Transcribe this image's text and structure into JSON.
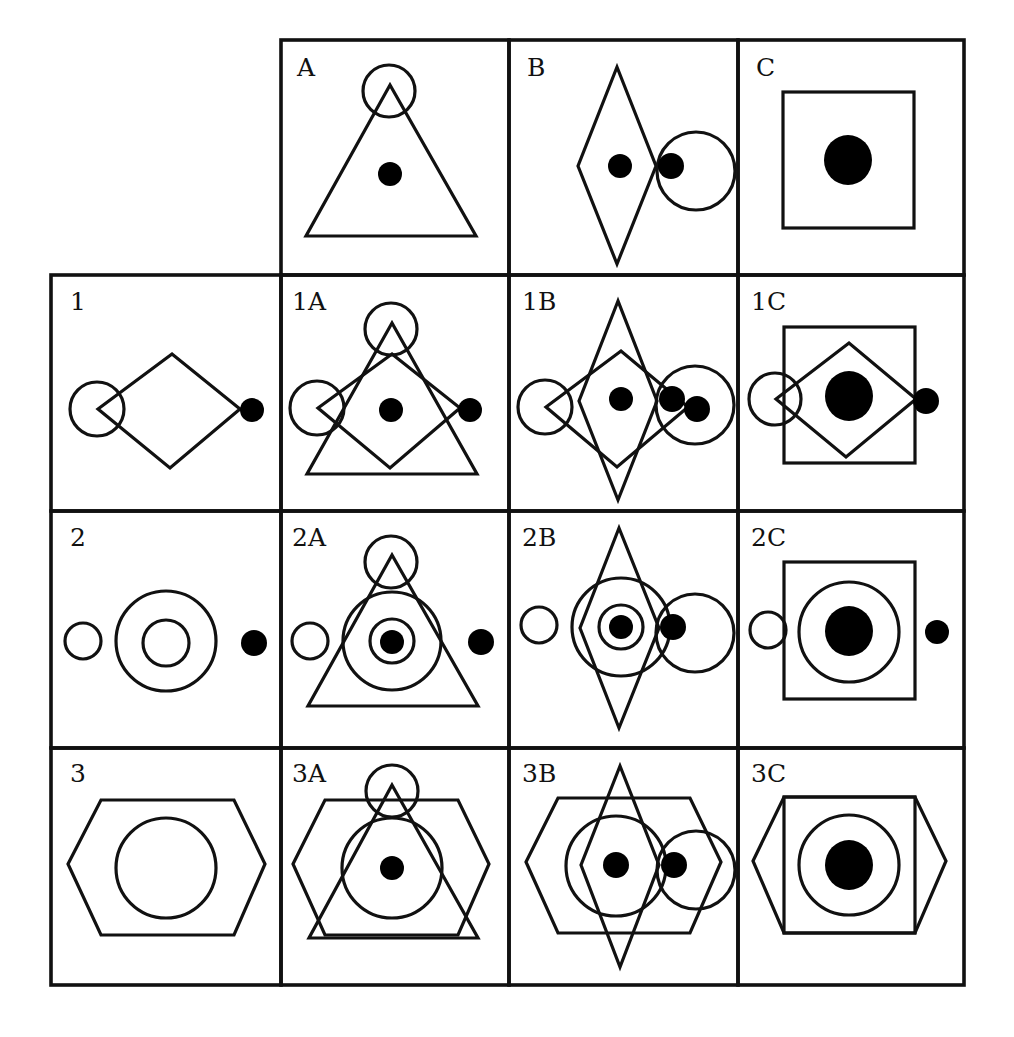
{
  "diagram": {
    "title": "",
    "grid": {
      "col_edges": [
        51,
        281,
        509,
        738,
        964
      ],
      "row_edges": [
        40,
        275,
        511,
        748,
        985
      ],
      "stroke_color": "#111111"
    },
    "cells": [
      {
        "id": "A",
        "label": "A",
        "col": 1,
        "row": 0,
        "label_pos": [
          297,
          76
        ],
        "shapes": [
          {
            "type": "polygon",
            "points": [
              [
                390,
                85
              ],
              [
                306,
                236
              ],
              [
                476,
                236
              ]
            ]
          },
          {
            "type": "circle",
            "cx": 389,
            "cy": 91,
            "r": 26
          },
          {
            "type": "dot",
            "cx": 390,
            "cy": 174,
            "r": 12
          }
        ]
      },
      {
        "id": "B",
        "label": "B",
        "col": 2,
        "row": 0,
        "label_pos": [
          527,
          76
        ],
        "shapes": [
          {
            "type": "polygon",
            "points": [
              [
                617,
                67
              ],
              [
                578,
                166
              ],
              [
                617,
                264
              ],
              [
                656,
                166
              ]
            ]
          },
          {
            "type": "circle",
            "cx": 696,
            "cy": 171,
            "r": 39
          },
          {
            "type": "dot",
            "cx": 620,
            "cy": 166,
            "r": 12
          },
          {
            "type": "dot",
            "cx": 671,
            "cy": 166,
            "r": 13
          }
        ]
      },
      {
        "id": "C",
        "label": "C",
        "col": 3,
        "row": 0,
        "label_pos": [
          756,
          76
        ],
        "shapes": [
          {
            "type": "rect",
            "x": 783,
            "y": 92,
            "w": 131,
            "h": 136
          },
          {
            "type": "ellipse",
            "cx": 848,
            "cy": 160,
            "rx": 24,
            "ry": 25
          }
        ]
      },
      {
        "id": "1",
        "label": "1",
        "col": 0,
        "row": 1,
        "label_pos": [
          70,
          310
        ],
        "shapes": [
          {
            "type": "polygon",
            "points": [
              [
                98,
                409
              ],
              [
                172,
                354
              ],
              [
                240,
                409
              ],
              [
                170,
                468
              ]
            ]
          },
          {
            "type": "circle",
            "cx": 97,
            "cy": 409,
            "r": 27
          },
          {
            "type": "dot",
            "cx": 252,
            "cy": 410,
            "r": 12
          }
        ]
      },
      {
        "id": "1A",
        "label": "1A",
        "col": 1,
        "row": 1,
        "label_pos": [
          292,
          310
        ],
        "shapes": [
          {
            "type": "polygon",
            "points": [
              [
                392,
                323
              ],
              [
                307,
                474
              ],
              [
                477,
                474
              ]
            ]
          },
          {
            "type": "polygon",
            "points": [
              [
                318,
                408
              ],
              [
                392,
                354
              ],
              [
                460,
                408
              ],
              [
                390,
                468
              ]
            ]
          },
          {
            "type": "circle",
            "cx": 391,
            "cy": 329,
            "r": 26
          },
          {
            "type": "circle",
            "cx": 317,
            "cy": 408,
            "r": 27
          },
          {
            "type": "dot",
            "cx": 391,
            "cy": 410,
            "r": 12
          },
          {
            "type": "dot",
            "cx": 470,
            "cy": 410,
            "r": 12
          }
        ]
      },
      {
        "id": "1B",
        "label": "1B",
        "col": 2,
        "row": 1,
        "label_pos": [
          522,
          310
        ],
        "shapes": [
          {
            "type": "polygon",
            "points": [
              [
                618,
                301
              ],
              [
                579,
                401
              ],
              [
                618,
                500
              ],
              [
                657,
                401
              ]
            ]
          },
          {
            "type": "polygon",
            "points": [
              [
                546,
                407
              ],
              [
                621,
                351
              ],
              [
                688,
                407
              ],
              [
                617,
                467
              ]
            ]
          },
          {
            "type": "circle",
            "cx": 545,
            "cy": 407,
            "r": 27
          },
          {
            "type": "circle",
            "cx": 695,
            "cy": 405,
            "r": 39
          },
          {
            "type": "dot",
            "cx": 621,
            "cy": 399,
            "r": 12
          },
          {
            "type": "dot",
            "cx": 672,
            "cy": 399,
            "r": 13
          },
          {
            "type": "dot",
            "cx": 697,
            "cy": 409,
            "r": 13
          }
        ]
      },
      {
        "id": "1C",
        "label": "1C",
        "col": 3,
        "row": 1,
        "label_pos": [
          751,
          310
        ],
        "shapes": [
          {
            "type": "rect",
            "x": 784,
            "y": 327,
            "w": 131,
            "h": 136
          },
          {
            "type": "polygon",
            "points": [
              [
                776,
                399
              ],
              [
                849,
                343
              ],
              [
                916,
                399
              ],
              [
                846,
                457
              ]
            ]
          },
          {
            "type": "circle",
            "cx": 775,
            "cy": 399,
            "r": 26
          },
          {
            "type": "ellipse",
            "cx": 849,
            "cy": 396,
            "rx": 24,
            "ry": 25
          },
          {
            "type": "dot",
            "cx": 926,
            "cy": 401,
            "r": 13
          }
        ]
      },
      {
        "id": "2",
        "label": "2",
        "col": 0,
        "row": 2,
        "label_pos": [
          70,
          546
        ],
        "shapes": [
          {
            "type": "circle",
            "cx": 83,
            "cy": 641,
            "r": 18
          },
          {
            "type": "circle",
            "cx": 166,
            "cy": 641,
            "r": 50
          },
          {
            "type": "circle",
            "cx": 166,
            "cy": 643,
            "r": 23
          },
          {
            "type": "dot",
            "cx": 254,
            "cy": 643,
            "r": 13
          }
        ]
      },
      {
        "id": "2A",
        "label": "2A",
        "col": 1,
        "row": 2,
        "label_pos": [
          292,
          546
        ],
        "shapes": [
          {
            "type": "polygon",
            "points": [
              [
                392,
                555
              ],
              [
                308,
                706
              ],
              [
                478,
                706
              ]
            ]
          },
          {
            "type": "circle",
            "cx": 391,
            "cy": 562,
            "r": 26
          },
          {
            "type": "circle",
            "cx": 392,
            "cy": 641,
            "r": 49
          },
          {
            "type": "circle",
            "cx": 392,
            "cy": 641,
            "r": 22
          },
          {
            "type": "circle",
            "cx": 310,
            "cy": 641,
            "r": 18
          },
          {
            "type": "dot",
            "cx": 392,
            "cy": 642,
            "r": 12
          },
          {
            "type": "dot",
            "cx": 481,
            "cy": 642,
            "r": 13
          }
        ]
      },
      {
        "id": "2B",
        "label": "2B",
        "col": 2,
        "row": 2,
        "label_pos": [
          522,
          546
        ],
        "shapes": [
          {
            "type": "polygon",
            "points": [
              [
                619,
                528
              ],
              [
                580,
                628
              ],
              [
                619,
                728
              ],
              [
                659,
                628
              ]
            ]
          },
          {
            "type": "circle",
            "cx": 621,
            "cy": 627,
            "r": 49
          },
          {
            "type": "circle",
            "cx": 621,
            "cy": 627,
            "r": 22
          },
          {
            "type": "circle",
            "cx": 539,
            "cy": 625,
            "r": 18
          },
          {
            "type": "circle",
            "cx": 695,
            "cy": 633,
            "r": 39
          },
          {
            "type": "dot",
            "cx": 621,
            "cy": 627,
            "r": 12
          },
          {
            "type": "dot",
            "cx": 673,
            "cy": 627,
            "r": 13
          }
        ]
      },
      {
        "id": "2C",
        "label": "2C",
        "col": 3,
        "row": 2,
        "label_pos": [
          751,
          546
        ],
        "shapes": [
          {
            "type": "rect",
            "x": 784,
            "y": 562,
            "w": 131,
            "h": 137
          },
          {
            "type": "circle",
            "cx": 849,
            "cy": 632,
            "r": 50
          },
          {
            "type": "circle",
            "cx": 768,
            "cy": 630,
            "r": 18
          },
          {
            "type": "ellipse",
            "cx": 849,
            "cy": 631,
            "rx": 24,
            "ry": 25
          },
          {
            "type": "dot",
            "cx": 937,
            "cy": 632,
            "r": 12
          }
        ]
      },
      {
        "id": "3",
        "label": "3",
        "col": 0,
        "row": 3,
        "label_pos": [
          70,
          782
        ],
        "shapes": [
          {
            "type": "polygon",
            "points": [
              [
                68,
                864
              ],
              [
                101,
                800
              ],
              [
                234,
                800
              ],
              [
                265,
                864
              ],
              [
                234,
                935
              ],
              [
                101,
                935
              ]
            ]
          },
          {
            "type": "circle",
            "cx": 166,
            "cy": 868,
            "r": 50
          }
        ]
      },
      {
        "id": "3A",
        "label": "3A",
        "col": 1,
        "row": 3,
        "label_pos": [
          292,
          782
        ],
        "shapes": [
          {
            "type": "polygon",
            "points": [
              [
                293,
                864
              ],
              [
                325,
                800
              ],
              [
                458,
                800
              ],
              [
                489,
                864
              ],
              [
                458,
                935
              ],
              [
                325,
                935
              ]
            ]
          },
          {
            "type": "polygon",
            "points": [
              [
                392,
                785
              ],
              [
                309,
                938
              ],
              [
                478,
                938
              ]
            ]
          },
          {
            "type": "circle",
            "cx": 392,
            "cy": 791,
            "r": 26
          },
          {
            "type": "circle",
            "cx": 392,
            "cy": 868,
            "r": 50
          },
          {
            "type": "dot",
            "cx": 392,
            "cy": 868,
            "r": 12
          }
        ]
      },
      {
        "id": "3B",
        "label": "3B",
        "col": 2,
        "row": 3,
        "label_pos": [
          522,
          782
        ],
        "shapes": [
          {
            "type": "polygon",
            "points": [
              [
                526,
                862
              ],
              [
                558,
                798
              ],
              [
                690,
                798
              ],
              [
                721,
                862
              ],
              [
                690,
                933
              ],
              [
                558,
                933
              ]
            ]
          },
          {
            "type": "polygon",
            "points": [
              [
                620,
                766
              ],
              [
                581,
                865
              ],
              [
                620,
                967
              ],
              [
                659,
                865
              ]
            ]
          },
          {
            "type": "circle",
            "cx": 616,
            "cy": 866,
            "r": 50
          },
          {
            "type": "circle",
            "cx": 696,
            "cy": 870,
            "r": 39
          },
          {
            "type": "dot",
            "cx": 616,
            "cy": 865,
            "r": 13
          },
          {
            "type": "dot",
            "cx": 674,
            "cy": 865,
            "r": 13
          }
        ]
      },
      {
        "id": "3C",
        "label": "3C",
        "col": 3,
        "row": 3,
        "label_pos": [
          751,
          782
        ],
        "shapes": [
          {
            "type": "polygon",
            "points": [
              [
                753,
                861
              ],
              [
                784,
                797
              ],
              [
                915,
                797
              ],
              [
                946,
                861
              ],
              [
                915,
                933
              ],
              [
                784,
                933
              ]
            ]
          },
          {
            "type": "rect",
            "x": 784,
            "y": 797,
            "w": 131,
            "h": 136
          },
          {
            "type": "circle",
            "cx": 849,
            "cy": 865,
            "r": 50
          },
          {
            "type": "ellipse",
            "cx": 849,
            "cy": 865,
            "rx": 24,
            "ry": 25
          }
        ]
      }
    ]
  }
}
